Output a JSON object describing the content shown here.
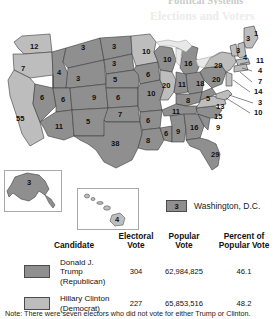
{
  "top_headline": "Political Systems",
  "top_ghost": "Elections and Voters",
  "map": {
    "title_alt": "2016 United States presidential election electoral map",
    "colors": {
      "trump": "#8f8f8f",
      "clinton": "#bdbdbd",
      "border": "#3c3c3c",
      "water": "#ffffff",
      "lake": "#e8e8e8"
    },
    "states": [
      {
        "code": "WA",
        "ev": "12",
        "party": "clinton",
        "x": 30,
        "y": 25
      },
      {
        "code": "OR",
        "ev": "7",
        "party": "clinton",
        "x": 21,
        "y": 47
      },
      {
        "code": "CA",
        "ev": "55",
        "party": "clinton",
        "x": 16,
        "y": 97
      },
      {
        "code": "NV",
        "ev": "6",
        "party": "trump",
        "x": 40,
        "y": 76
      },
      {
        "code": "ID",
        "ev": "4",
        "party": "trump",
        "x": 57,
        "y": 51
      },
      {
        "code": "MT",
        "ev": "3",
        "party": "trump",
        "x": 81,
        "y": 26
      },
      {
        "code": "WY",
        "ev": "3",
        "party": "trump",
        "x": 76,
        "y": 57
      },
      {
        "code": "UT",
        "ev": "6",
        "party": "trump",
        "x": 61,
        "y": 78
      },
      {
        "code": "AZ",
        "ev": "11",
        "party": "trump",
        "x": 55,
        "y": 105
      },
      {
        "code": "NM",
        "ev": "5",
        "party": "trump",
        "x": 86,
        "y": 110
      },
      {
        "code": "CO",
        "ev": "9",
        "party": "trump",
        "x": 94,
        "y": 81
      },
      {
        "code": "ND",
        "ev": "3",
        "party": "trump",
        "x": 112,
        "y": 27
      },
      {
        "code": "SD",
        "ev": "3",
        "party": "trump",
        "x": 112,
        "y": 44
      },
      {
        "code": "NE",
        "ev": "5",
        "party": "trump",
        "x": 113,
        "y": 60
      },
      {
        "code": "KS",
        "ev": "6",
        "party": "trump",
        "x": 116,
        "y": 78
      },
      {
        "code": "OK",
        "ev": "7",
        "party": "trump",
        "x": 118,
        "y": 96
      },
      {
        "code": "TX",
        "ev": "38",
        "party": "trump",
        "x": 113,
        "y": 126
      },
      {
        "code": "MN",
        "ev": "10",
        "party": "clinton",
        "x": 144,
        "y": 36
      },
      {
        "code": "IA",
        "ev": "6",
        "party": "trump",
        "x": 148,
        "y": 59
      },
      {
        "code": "MO",
        "ev": "10",
        "party": "trump",
        "x": 150,
        "y": 82
      },
      {
        "code": "AR",
        "ev": "6",
        "party": "trump",
        "x": 146,
        "y": 104
      },
      {
        "code": "LA",
        "ev": "8",
        "party": "trump",
        "x": 150,
        "y": 124
      },
      {
        "code": "WI",
        "ev": "10",
        "party": "trump",
        "x": 166,
        "y": 40
      },
      {
        "code": "IL",
        "ev": "20",
        "party": "clinton",
        "x": 164,
        "y": 63
      },
      {
        "code": "MS",
        "ev": "6",
        "party": "trump",
        "x": 164,
        "y": 115
      },
      {
        "code": "MI",
        "ev": "16",
        "party": "trump",
        "x": 187,
        "y": 48
      },
      {
        "code": "IN",
        "ev": "11",
        "party": "trump",
        "x": 181,
        "y": 64
      },
      {
        "code": "TN",
        "ev": "11",
        "party": "trump",
        "x": 175,
        "y": 95
      },
      {
        "code": "AL",
        "ev": "9",
        "party": "trump",
        "x": 176,
        "y": 115
      },
      {
        "code": "KY",
        "ev": "8",
        "party": "trump",
        "x": 186,
        "y": 82
      },
      {
        "code": "GA",
        "ev": "16",
        "party": "trump",
        "x": 192,
        "y": 113
      },
      {
        "code": "OH",
        "ev": "18",
        "party": "trump",
        "x": 198,
        "y": 66
      },
      {
        "code": "WV",
        "ev": "5",
        "party": "trump",
        "x": 206,
        "y": 85
      },
      {
        "code": "VA",
        "ev": "13",
        "party": "clinton",
        "x": 218,
        "y": 89
      },
      {
        "code": "NC",
        "ev": "15",
        "party": "trump",
        "x": 216,
        "y": 101
      },
      {
        "code": "SC",
        "ev": "9",
        "party": "trump",
        "x": 217,
        "y": 112
      },
      {
        "code": "FL",
        "ev": "29",
        "party": "trump",
        "x": 213,
        "y": 138
      },
      {
        "code": "PA",
        "ev": "20",
        "party": "trump",
        "x": 214,
        "y": 62
      },
      {
        "code": "NY",
        "ev": "29",
        "party": "clinton",
        "x": 219,
        "y": 44
      },
      {
        "code": "ME-a",
        "ev": "3",
        "party": "clinton",
        "x": 240,
        "y": 25
      },
      {
        "code": "ME-b",
        "ev": "1",
        "party": "trump",
        "x": 250,
        "y": 22
      },
      {
        "code": "VT",
        "ev": "3",
        "party": "clinton",
        "x": 236,
        "y": 34
      },
      {
        "code": "NH",
        "ev": "4",
        "party": "clinton",
        "x": 244,
        "y": 37
      },
      {
        "code": "AK",
        "ev": "3",
        "party": "trump",
        "x": 32,
        "y": 178
      },
      {
        "code": "HI",
        "ev": "4",
        "party": "clinton",
        "x": 126,
        "y": 217
      }
    ],
    "callouts": [
      {
        "code": "MA",
        "ev": "11",
        "x": 256,
        "y": 41
      },
      {
        "code": "RI",
        "ev": "4",
        "x": 258,
        "y": 51
      },
      {
        "code": "CT",
        "ev": "7",
        "x": 258,
        "y": 62
      },
      {
        "code": "NJ",
        "ev": "14",
        "x": 254,
        "y": 72
      },
      {
        "code": "DE",
        "ev": "3",
        "x": 258,
        "y": 83
      },
      {
        "code": "MD",
        "ev": "10",
        "x": 254,
        "y": 93
      }
    ]
  },
  "dc_key": {
    "value": "3",
    "label": "Washington, D.C."
  },
  "table": {
    "headers": {
      "candidate": "Candidate",
      "electoral_vote": "Electoral\nVote",
      "electoral_vote_l1": "Electoral",
      "electoral_vote_l2": "Vote",
      "popular_vote_l1": "Popular",
      "popular_vote_l2": "Vote",
      "percent_l1": "Percent of",
      "percent_l2": "Popular Vote"
    },
    "rows": [
      {
        "name_l1": "Donald J. Trump",
        "name_l2": "(Republican)",
        "electoral_vote": "304",
        "popular_vote": "62,984,825",
        "percent_popular_vote": "46.1",
        "color": "#8f8f8f"
      },
      {
        "name_l1": "Hillary Clinton",
        "name_l2": "(Democrat)",
        "electoral_vote": "227",
        "popular_vote": "65,853,516",
        "percent_popular_vote": "48.2",
        "color": "#bdbdbd"
      }
    ]
  },
  "note": "Note: There were seven electors who did not vote for either Trump or Clinton."
}
